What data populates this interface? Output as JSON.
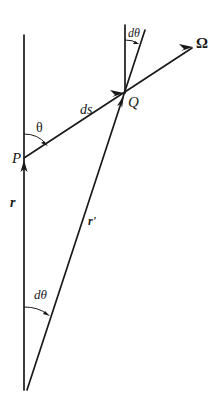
{
  "diagram": {
    "labels": {
      "P": "P",
      "Q": "Q",
      "ds": "ds",
      "theta": "θ",
      "dtheta_top": "dθ",
      "dtheta_bottom": "dθ",
      "r": "r",
      "r_prime": "r'",
      "Omega": "Ω"
    },
    "colors": {
      "stroke": "#1a1a1a",
      "background": "#ffffff"
    }
  }
}
